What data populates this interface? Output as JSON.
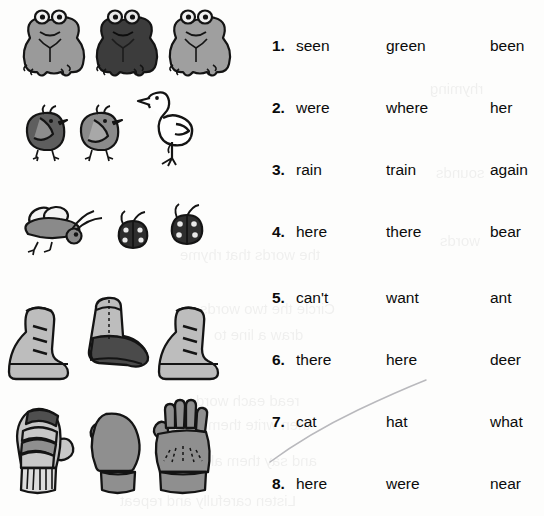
{
  "page": {
    "background_color": "#fdfdfc",
    "ink_color": "#0b0b0b",
    "width": 544,
    "height": 516
  },
  "word_list": {
    "columns": 3,
    "rows": [
      {
        "number": "1.",
        "col1": "seen",
        "col2": "green",
        "col3": "been"
      },
      {
        "number": "2.",
        "col1": "were",
        "col2": "where",
        "col3": "her"
      },
      {
        "number": "3.",
        "col1": "rain",
        "col2": "train",
        "col3": "again"
      },
      {
        "number": "4.",
        "col1": "here",
        "col2": "there",
        "col3": "bear"
      },
      {
        "number": "5.",
        "col1": "can't",
        "col2": "want",
        "col3": "ant"
      },
      {
        "number": "6.",
        "col1": "there",
        "col2": "here",
        "col3": "deer"
      },
      {
        "number": "7.",
        "col1": "cat",
        "col2": "hat",
        "col3": "what"
      },
      {
        "number": "8.",
        "col1": "here",
        "col2": "were",
        "col3": "near"
      }
    ]
  },
  "illustrations": {
    "rows": [
      {
        "name": "frogs",
        "label": "three frogs",
        "items": [
          "frog-light",
          "frog-dark",
          "frog-light"
        ],
        "colors": {
          "light": "#9a9a9a",
          "dark": "#3c3c3c",
          "outline": "#141414"
        }
      },
      {
        "name": "chicks-and-duck",
        "label": "two chicks and a duck",
        "items": [
          "chick-dark",
          "chick-medium",
          "duck-white"
        ],
        "colors": {
          "dark": "#5e5e5e",
          "medium": "#8a8a8a",
          "white": "#ffffff",
          "outline": "#141414"
        }
      },
      {
        "name": "bug-and-ladybugs",
        "label": "a fly and two ladybugs",
        "items": [
          "fly",
          "ladybug",
          "ladybug"
        ],
        "colors": {
          "body": "#8a8a8a",
          "dark": "#2e2e2e",
          "outline": "#141414"
        }
      },
      {
        "name": "boots",
        "label": "three boots",
        "items": [
          "boot-light",
          "boot-cowboy-dark",
          "boot-light"
        ],
        "colors": {
          "light": "#bdbdbd",
          "dark": "#4a4a4a",
          "outline": "#141414"
        }
      },
      {
        "name": "mittens-and-glove",
        "label": "two mittens and a glove",
        "items": [
          "mitten-striped",
          "mitten-plain",
          "glove"
        ],
        "colors": {
          "light": "#c8c8c8",
          "mid": "#8f8f8f",
          "dark": "#4f4f4f",
          "outline": "#141414"
        }
      }
    ]
  },
  "pencil_mark": {
    "name": "hand-drawn-curve",
    "description": "faint pencil arc sweeping up to the right between rows 6 and 7",
    "color": "#b9b9bd"
  },
  "bleed_through": {
    "description": "faint mirrored text showing through from the reverse side of the page",
    "lines": [
      {
        "text": "the words that rhyme",
        "x": 180,
        "y": 246
      },
      {
        "text": "Circle the two words",
        "x": 200,
        "y": 300
      },
      {
        "text": "draw a line to",
        "x": 214,
        "y": 326
      },
      {
        "text": "read each word",
        "x": 196,
        "y": 392
      },
      {
        "text": "then write them",
        "x": 208,
        "y": 416
      },
      {
        "text": "and say them aloud",
        "x": 186,
        "y": 452
      },
      {
        "text": "Listen carefully and repeat",
        "x": 120,
        "y": 492
      },
      {
        "text": "rhyming",
        "x": 430,
        "y": 80
      },
      {
        "text": "sounds",
        "x": 436,
        "y": 164
      },
      {
        "text": "words",
        "x": 440,
        "y": 232
      }
    ]
  }
}
